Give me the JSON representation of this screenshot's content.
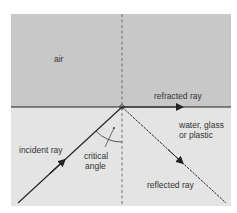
{
  "diagram": {
    "regions": {
      "upper": "air",
      "lower": "water, glass or plastic",
      "lower_line1": "water, glass",
      "lower_line2": "or plastic"
    },
    "rays": {
      "incident": "incident ray",
      "refracted": "refracted ray",
      "reflected": "reflected ray"
    },
    "angle_label_line1": "critical",
    "angle_label_line2": "angle",
    "colors": {
      "air": "#c8c8c8",
      "medium": "#e4e4e4",
      "line": "#222222",
      "text": "#333333"
    }
  }
}
